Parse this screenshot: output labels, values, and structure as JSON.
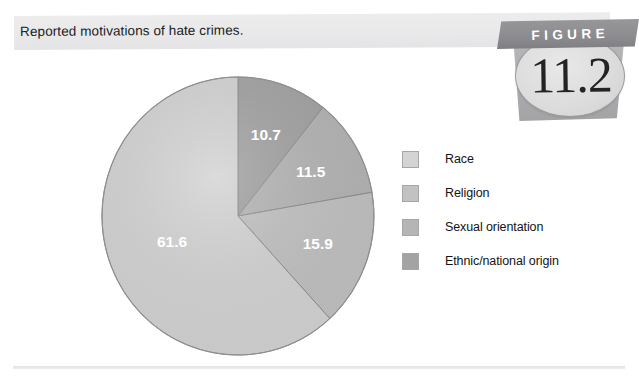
{
  "figure": {
    "title": "Reported motivations of hate crimes.",
    "badge_banner_label": "FIGURE",
    "badge_number": "11.2"
  },
  "legend": {
    "items": [
      {
        "label": "Race",
        "color": "#d4d4d4"
      },
      {
        "label": "Religion",
        "color": "#c2c2c2"
      },
      {
        "label": "Sexual orientation",
        "color": "#b5b5b5"
      },
      {
        "label": "Ethnic/national origin",
        "color": "#a3a3a3"
      }
    ]
  },
  "chart_data": {
    "type": "pie",
    "title": "Reported motivations of hate crimes.",
    "unit": "percent",
    "legend_position": "right",
    "start_angle_deg": 0,
    "direction": "clockwise",
    "categories": [
      "Ethnic/national origin",
      "Sexual orientation",
      "Religion",
      "Race"
    ],
    "values": [
      10.7,
      11.5,
      15.9,
      61.6
    ],
    "colors": [
      "#a3a3a3",
      "#b5b5b5",
      "#c2c2c2",
      "#d4d4d4"
    ],
    "labels": [
      "10.7",
      "11.5",
      "15.9",
      "61.6"
    ],
    "slices": [
      {
        "name": "Ethnic/national origin",
        "value": 10.7,
        "label": "10.7",
        "color": "#a3a3a3"
      },
      {
        "name": "Sexual orientation",
        "value": 11.5,
        "label": "11.5",
        "color": "#b5b5b5"
      },
      {
        "name": "Religion",
        "value": 15.9,
        "label": "15.9",
        "color": "#c2c2c2"
      },
      {
        "name": "Race",
        "value": 61.6,
        "label": "61.6",
        "color": "#d4d4d4"
      }
    ]
  }
}
